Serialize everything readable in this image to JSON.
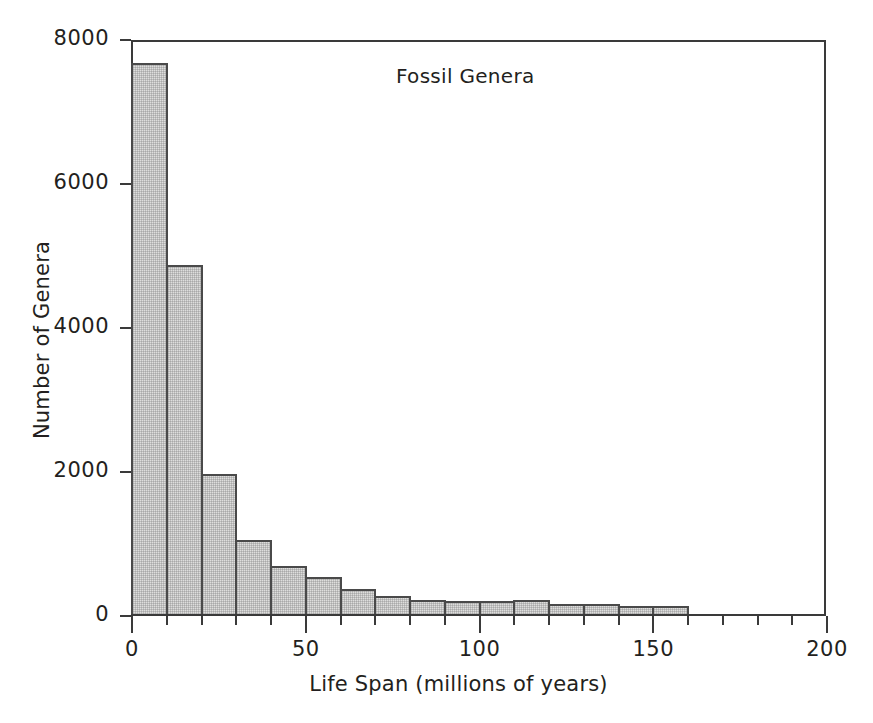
{
  "chart_data": {
    "type": "bar",
    "title": "Fossil Genera",
    "xlabel": "Life Span (millions of years)",
    "ylabel": "Number of Genera",
    "xlim": [
      0,
      200
    ],
    "ylim": [
      0,
      8000
    ],
    "grid": false,
    "legend": null,
    "bin_width": 10,
    "x_tick_labels": [
      "0",
      "50",
      "100",
      "150",
      "200"
    ],
    "x_tick_values": [
      0,
      50,
      100,
      150,
      200
    ],
    "x_minor_tick_step": 10,
    "y_tick_labels": [
      "0",
      "2000",
      "4000",
      "6000",
      "8000"
    ],
    "y_tick_values": [
      0,
      2000,
      4000,
      6000,
      8000
    ],
    "categories": [
      "0-10",
      "10-20",
      "20-30",
      "30-40",
      "40-50",
      "50-60",
      "60-70",
      "70-80",
      "80-90",
      "90-100",
      "100-110",
      "110-120",
      "120-130",
      "130-140",
      "140-150",
      "150-160"
    ],
    "bin_edges": [
      0,
      10,
      20,
      30,
      40,
      50,
      60,
      70,
      80,
      90,
      100,
      110,
      120,
      130,
      140,
      150,
      160
    ],
    "values": [
      7650,
      4850,
      1950,
      1030,
      670,
      520,
      350,
      250,
      190,
      185,
      185,
      190,
      140,
      135,
      110,
      105
    ]
  },
  "figure": {
    "bar_fill_color": "#dededd",
    "bar_edge_color": "#4a4a4a",
    "axis_color": "#3a3a3a",
    "background_color": "#ffffff",
    "text_color": "#231f20"
  }
}
